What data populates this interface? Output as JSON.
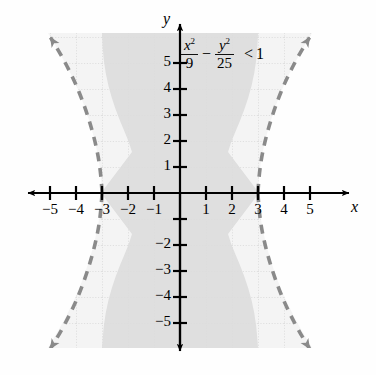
{
  "figure": {
    "kind": "coordinate-plane-graph",
    "background_color": "#fefefe",
    "grid_fill_color": "#f2f2f2",
    "grid_line_color": "#cfcfcf",
    "axis_color": "#000000",
    "curve_color": "#8a8a8a",
    "shade_color": "#dcdcdc"
  },
  "equation": {
    "numerator_1": "x",
    "exponent_1": "2",
    "denominator_1": "9",
    "operator": "−",
    "numerator_2": "y",
    "exponent_2": "2",
    "denominator_2": "25",
    "relation": "<",
    "right_side": "1",
    "plain": "x²/9 − y²/25 < 1"
  },
  "axes": {
    "x_axis_label": "x",
    "y_axis_label": "y",
    "x_ticks": [
      -5,
      -4,
      -3,
      -2,
      -1,
      1,
      2,
      3,
      4,
      5
    ],
    "x_tick_labels": [
      "−5",
      "−4",
      "−3",
      "−2",
      "−1",
      "1",
      "2",
      "3",
      "4",
      "5"
    ],
    "y_ticks": [
      -5,
      -4,
      -3,
      -2,
      -1,
      1,
      2,
      3,
      4,
      5
    ],
    "y_tick_labels": [
      "−5",
      "−4",
      "−3",
      "−2",
      "",
      "1",
      "2",
      "3",
      "4",
      "5"
    ],
    "xlim": [
      -6.0,
      6.4
    ],
    "ylim": [
      -6.2,
      6.2
    ],
    "grid": true,
    "arrows": [
      "left",
      "right",
      "up",
      "down"
    ]
  },
  "chart_data": {
    "type": "line",
    "title": "",
    "xlabel": "x",
    "ylabel": "y",
    "xlim": [
      -6.0,
      6.4
    ],
    "ylim": [
      -6.2,
      6.2
    ],
    "grid": true,
    "legend": "none",
    "curve_style": "dashed",
    "boundary_included": false,
    "shaded_region": "between the two branches (interior containing the origin)",
    "conic": {
      "name": "hyperbola",
      "form": "x^2/a^2 - y^2/b^2 = 1",
      "a": 3,
      "b": 5,
      "a_squared": 9,
      "b_squared": 25,
      "orientation": "horizontal",
      "center": [
        0,
        0
      ],
      "vertices": [
        [
          -3,
          0
        ],
        [
          3,
          0
        ]
      ],
      "asymptote_slopes": [
        1.6667,
        -1.6667
      ]
    },
    "series": [
      {
        "name": "right branch (dashed)",
        "x": [
          3.0,
          3.02,
          3.09,
          3.2,
          3.35,
          3.54,
          3.76,
          4.02,
          4.3,
          4.61,
          4.93,
          5.28
        ],
        "y": [
          0.0,
          0.5,
          1.0,
          1.5,
          2.0,
          2.5,
          3.0,
          3.5,
          4.0,
          4.5,
          5.0,
          5.5
        ]
      },
      {
        "name": "right branch lower (dashed)",
        "x": [
          3.0,
          3.02,
          3.09,
          3.2,
          3.35,
          3.54,
          3.76,
          4.02,
          4.3,
          4.61,
          4.93,
          5.28
        ],
        "y": [
          0.0,
          -0.5,
          -1.0,
          -1.5,
          -2.0,
          -2.5,
          -3.0,
          -3.5,
          -4.0,
          -4.5,
          -5.0,
          -5.5
        ]
      },
      {
        "name": "left branch (dashed)",
        "x": [
          -3.0,
          -3.02,
          -3.09,
          -3.2,
          -3.35,
          -3.54,
          -3.76,
          -4.02,
          -4.3,
          -4.61,
          -4.93,
          -5.28
        ],
        "y": [
          0.0,
          0.5,
          1.0,
          1.5,
          2.0,
          2.5,
          3.0,
          3.5,
          4.0,
          4.5,
          5.0,
          5.5
        ]
      },
      {
        "name": "left branch lower (dashed)",
        "x": [
          -3.0,
          -3.02,
          -3.09,
          -3.2,
          -3.35,
          -3.54,
          -3.76,
          -4.02,
          -4.3,
          -4.61,
          -4.93,
          -5.28
        ],
        "y": [
          0.0,
          -0.5,
          -1.0,
          -1.5,
          -2.0,
          -2.5,
          -3.0,
          -3.5,
          -4.0,
          -4.5,
          -5.0,
          -5.5
        ]
      }
    ],
    "annotations": [
      {
        "text": "x²/9 − y²/25 < 1",
        "x": 0.4,
        "y": 5.1
      }
    ]
  }
}
